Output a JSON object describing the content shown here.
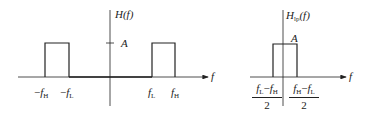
{
  "figure": {
    "left_plot": {
      "y_label": "H(f)",
      "x_label": "f",
      "amplitude_label": "A",
      "tick_labels": {
        "neg_fH": {
          "sign": "−",
          "base": "f",
          "sub": "H"
        },
        "neg_fL": {
          "sign": "−",
          "base": "f",
          "sub": "L"
        },
        "fL": {
          "sign": "",
          "base": "f",
          "sub": "L"
        },
        "fH": {
          "sign": "",
          "base": "f",
          "sub": "H"
        }
      }
    },
    "right_plot": {
      "y_label_base": "H",
      "y_label_sub": "lp",
      "y_label_tail": "(f)",
      "x_label": "f",
      "amplitude_label": "A",
      "left_fraction": {
        "num": "fL − fH",
        "num_a": "f",
        "num_a_sub": "L",
        "num_op": "−",
        "num_b": "f",
        "num_b_sub": "H",
        "den": "2"
      },
      "right_fraction": {
        "num": "fH − fL",
        "num_a": "f",
        "num_a_sub": "H",
        "num_op": "−",
        "num_b": "f",
        "num_b_sub": "L",
        "den": "2"
      }
    },
    "stroke_color": "#222222"
  }
}
